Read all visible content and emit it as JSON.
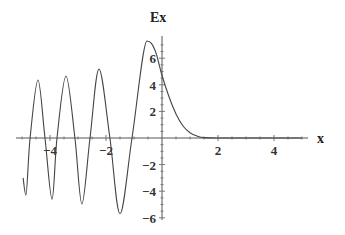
{
  "chart_data": {
    "type": "line",
    "title": "",
    "xlabel": "x",
    "ylabel": "Ex",
    "xlim": [
      -5.2,
      5.2
    ],
    "ylim": [
      -6.2,
      7.6
    ],
    "grid": false,
    "legend": null,
    "x_ticks": [
      -4,
      -2,
      2,
      4
    ],
    "x_tick_labels": [
      "-4",
      "-2",
      "2",
      "4"
    ],
    "y_ticks": [
      -6,
      -4,
      -2,
      2,
      4,
      6
    ],
    "y_tick_labels": [
      "-6",
      "-4",
      "-2",
      "2",
      "4",
      "6"
    ],
    "series": [
      {
        "name": "Ex",
        "x": [
          -4.96,
          -4.86,
          -4.71,
          -4.43,
          -4.18,
          -3.93,
          -3.75,
          -3.43,
          -3.11,
          -2.86,
          -2.57,
          -2.25,
          -1.86,
          -1.5,
          -1.07,
          -0.54,
          -0.25,
          0.0,
          0.25,
          0.5,
          0.75,
          1.0,
          1.25,
          1.5,
          2.0,
          3.0,
          4.0,
          5.0
        ],
        "y": [
          -3.0,
          -4.3,
          0.0,
          4.36,
          0.0,
          -4.6,
          0.0,
          4.66,
          0.0,
          -4.96,
          0.0,
          5.19,
          0.0,
          -5.7,
          0.0,
          7.29,
          6.6,
          4.7,
          3.1,
          1.8,
          0.9,
          0.4,
          0.15,
          0.03,
          0.0,
          0.0,
          0.0,
          0.0
        ]
      }
    ]
  },
  "axes": {
    "x_label": "x",
    "y_label": "Ex"
  }
}
